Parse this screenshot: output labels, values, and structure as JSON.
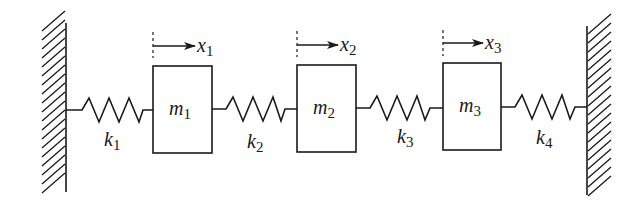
{
  "diagram": {
    "type": "spring-mass system",
    "walls": [
      {
        "id": "left-wall",
        "x": 66,
        "y_top": 23,
        "y_bottom": 192,
        "hatch_side": "left"
      },
      {
        "id": "right-wall",
        "x": 587,
        "y_top": 26,
        "y_bottom": 195,
        "hatch_side": "right"
      }
    ],
    "masses": [
      {
        "id": "m1",
        "label": "m",
        "sub": "1",
        "x": 153,
        "y": 66,
        "w": 59,
        "h": 87
      },
      {
        "id": "m2",
        "label": "m",
        "sub": "2",
        "x": 297,
        "y": 65,
        "w": 59,
        "h": 87
      },
      {
        "id": "m3",
        "label": "m",
        "sub": "3",
        "x": 443,
        "y": 63,
        "w": 58,
        "h": 87
      }
    ],
    "springs": [
      {
        "id": "k1",
        "label": "k",
        "sub": "1",
        "x1": 66,
        "x2": 153,
        "y": 110
      },
      {
        "id": "k2",
        "label": "k",
        "sub": "2",
        "x1": 212,
        "x2": 297,
        "y": 109
      },
      {
        "id": "k3",
        "label": "k",
        "sub": "3",
        "x1": 356,
        "x2": 443,
        "y": 108
      },
      {
        "id": "k4",
        "label": "k",
        "sub": "4",
        "x1": 501,
        "x2": 587,
        "y": 107
      }
    ],
    "displacements": [
      {
        "id": "x1",
        "label": "x",
        "sub": "1",
        "x": 153,
        "y": 46
      },
      {
        "id": "x2",
        "label": "x",
        "sub": "2",
        "x": 297,
        "y": 45
      },
      {
        "id": "x3",
        "label": "x",
        "sub": "3",
        "x": 443,
        "y": 43
      }
    ],
    "labels": {
      "m1": "m",
      "m1_sub": "1",
      "m2": "m",
      "m2_sub": "2",
      "m3": "m",
      "m3_sub": "3",
      "k1": "k",
      "k1_sub": "1",
      "k2": "k",
      "k2_sub": "2",
      "k3": "k",
      "k3_sub": "3",
      "k4": "k",
      "k4_sub": "4",
      "x1": "x",
      "x1_sub": "1",
      "x2": "x",
      "x2_sub": "2",
      "x3": "x",
      "x3_sub": "3"
    }
  }
}
